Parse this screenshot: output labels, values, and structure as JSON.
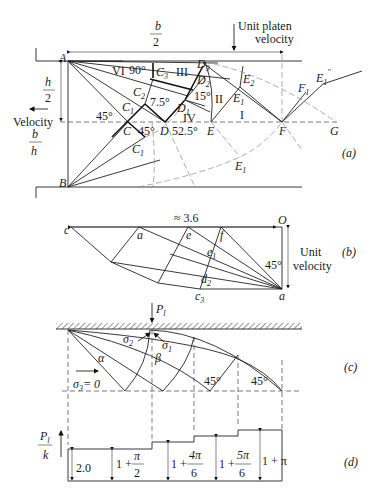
{
  "figure": {
    "panel_a": {
      "label": "(a)",
      "dimension_width": {
        "num": "b",
        "den": "2"
      },
      "dimension_height": {
        "num": "h",
        "den": "2"
      },
      "ratio": {
        "num": "b",
        "den": "h"
      },
      "velocity_label": "Velocity",
      "platen_label_line1": "Unit platen",
      "platen_label_line2": "velocity",
      "points": [
        "A",
        "B",
        "C",
        "D",
        "E",
        "F",
        "G",
        "C1",
        "C2",
        "C3",
        "D1",
        "D2",
        "D3",
        "E1",
        "E2",
        "F1",
        "E1''"
      ],
      "point_labels": {
        "A": "A",
        "B": "B",
        "C": "C",
        "D": "D",
        "E": "E",
        "F": "F",
        "G": "G",
        "C1": "C",
        "C2": "C",
        "C3": "C",
        "D1": "D",
        "D2": "D",
        "D3": "D",
        "E1": "E",
        "E2": "E",
        "F1": "F",
        "E1b": "E",
        "E1c": "E1",
        "C1b": "C",
        "E1d": "E"
      },
      "subscripts": {
        "one": "1",
        "two": "2",
        "three": "3",
        "dprime": "''"
      },
      "regions": [
        "I",
        "II",
        "III",
        "IV",
        "VI"
      ],
      "angles": {
        "a90": "90°",
        "a75": "7.5°",
        "a15": "15°",
        "a45a": "45°",
        "a45b": "45°",
        "a525": "52.5°"
      }
    },
    "panel_b": {
      "label": "(b)",
      "length_label": "≈ 3.6",
      "points": {
        "c": "c",
        "a_top": "a",
        "e": "e",
        "f": "f",
        "e1": "e",
        "d2": "d",
        "c3": "c",
        "a_bottom": "a",
        "O": "O"
      },
      "angle": "45°",
      "velocity_line1": "Unit",
      "velocity_line2": "velocity"
    },
    "panel_c": {
      "label": "(c)",
      "load_label": "P",
      "load_sub": "l",
      "sigma1": "σ",
      "sigma2": "σ",
      "sigma3": "σ",
      "sigma3_value": "= 0",
      "alpha": "α",
      "beta": "β",
      "angle1": "45°",
      "angle2": "45°"
    },
    "panel_d": {
      "label": "(d)",
      "yaxis_num": "P",
      "yaxis_sub": "l",
      "yaxis_den": "k",
      "steps": [
        {
          "text": "2.0",
          "value": 2.0
        },
        {
          "prefix": "1 +",
          "num": "π",
          "den": "2",
          "value": 2.571
        },
        {
          "prefix": "1 +",
          "num": "4π",
          "den": "6",
          "value": 3.094
        },
        {
          "prefix": "1 +",
          "num": "5π",
          "den": "6",
          "value": 3.618
        },
        {
          "text": "1 + π",
          "value": 4.142
        }
      ]
    }
  }
}
